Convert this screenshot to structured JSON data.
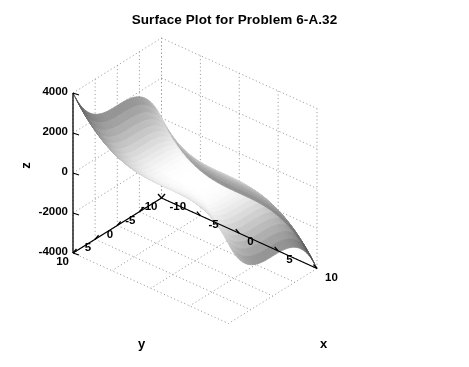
{
  "chart_data": {
    "type": "surface",
    "title": "Surface Plot for Problem 6-A.32",
    "xlabel": "x",
    "ylabel": "y",
    "zlabel": "z",
    "xlim": [
      -10,
      10
    ],
    "ylim": [
      -10,
      10
    ],
    "zlim": [
      -4000,
      4000
    ],
    "xticks": [
      -10,
      -5,
      0,
      5,
      10
    ],
    "yticks": [
      10,
      5,
      0,
      -5,
      -10
    ],
    "zticks": [
      4000,
      2000,
      0,
      -2000,
      -4000
    ],
    "xtick_labels": [
      "-10",
      "-5",
      "0",
      "5",
      "10"
    ],
    "ytick_labels": [
      "10",
      "5",
      "0",
      "-5",
      "-10"
    ],
    "ztick_labels": [
      "4000",
      "2000",
      "0",
      "-2000",
      "-4000"
    ],
    "grid": true,
    "legend": false,
    "colormap": "gray",
    "shading": "interp",
    "surface_function": "z = 2*(y^3 - x^3)",
    "view": {
      "azimuth": -37.5,
      "elevation": 30
    },
    "mesh_step": 1.0,
    "corner_values": [
      {
        "x": -10,
        "y": 10,
        "z": 4000,
        "position": "back-left",
        "shade": "dark"
      },
      {
        "x": 10,
        "y": -10,
        "z": -4000,
        "position": "front-right",
        "shade": "dark"
      },
      {
        "x": -10,
        "y": -10,
        "z": 0,
        "position": "front-left",
        "shade": "light"
      },
      {
        "x": 10,
        "y": 10,
        "z": 0,
        "position": "back-right",
        "shade": "light"
      },
      {
        "x": 0,
        "y": 0,
        "z": 0,
        "position": "saddle-center",
        "shade": "mid"
      }
    ]
  },
  "figure": {
    "background_color": "#ffffff",
    "axis_color": "#000000",
    "grid_color": "#9a9a9a"
  }
}
